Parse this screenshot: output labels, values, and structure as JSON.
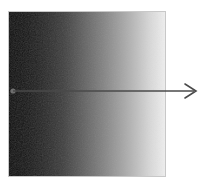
{
  "figure": {
    "name": "horizontal-grayscale-gradient-with-direction-arrow",
    "canvas": {
      "width": 203,
      "height": 185,
      "background_color": "#ffffff"
    },
    "gradient_panel": {
      "label": "grayscale gradient square",
      "x": 8,
      "y": 11,
      "width": 158,
      "height": 166,
      "direction": "left-to-right",
      "start_color": "#050505",
      "mid_color": "#6a6a6a",
      "end_color": "#efefef",
      "border_color": "#c8c8c8",
      "border_width": 1,
      "texture": "fine dithering noise"
    },
    "arrow": {
      "label": "gradient direction arrow",
      "color": "#4a4a4a",
      "line_width": 1.4,
      "start_x": 13,
      "start_y": 91,
      "end_x": 196,
      "end_y": 91,
      "head_style": "open-v",
      "head_length": 11,
      "head_half_height": 7,
      "origin_dot": {
        "label": "arrow origin dot",
        "cx": 13,
        "cy": 91,
        "r": 2.6,
        "color": "#6e6e6e"
      }
    }
  }
}
